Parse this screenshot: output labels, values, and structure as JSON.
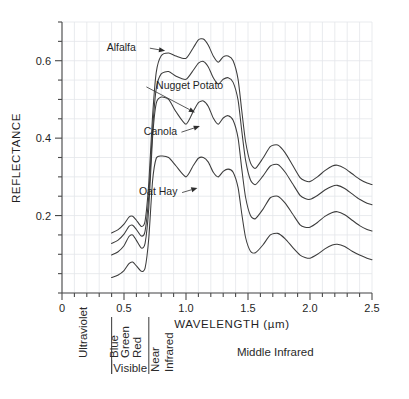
{
  "chart_data": {
    "type": "line",
    "title": "",
    "xlabel": "WAVELENGTH (µm)",
    "ylabel": "REFLECTANCE",
    "xlim": [
      0,
      2.5
    ],
    "ylim": [
      0,
      0.7
    ],
    "x_ticks": [
      "0",
      "0.5",
      "1.0",
      "1.5",
      "2.0",
      "2.5"
    ],
    "x_tick_values": [
      0,
      0.5,
      1.0,
      1.5,
      2.0,
      2.5
    ],
    "x_minor_step": 0.1,
    "y_ticks": [
      "0.2",
      "0.4",
      "0.6"
    ],
    "y_tick_values": [
      0.2,
      0.4,
      0.6
    ],
    "y_minor_step": 0.05,
    "grid": true,
    "legend_position": "inline-annotations",
    "series": [
      {
        "name": "Alfalfa",
        "label_x": 0.36,
        "label_y": 0.635,
        "arrow_to_x": 0.84,
        "arrow_to_y": 0.625,
        "x": [
          0.4,
          0.45,
          0.5,
          0.54,
          0.57,
          0.6,
          0.64,
          0.67,
          0.7,
          0.73,
          0.76,
          0.8,
          0.86,
          0.92,
          1.0,
          1.06,
          1.1,
          1.14,
          1.18,
          1.22,
          1.26,
          1.3,
          1.34,
          1.38,
          1.42,
          1.45,
          1.48,
          1.52,
          1.56,
          1.62,
          1.68,
          1.74,
          1.8,
          1.86,
          1.92,
          1.96,
          2.0,
          2.06,
          2.12,
          2.18,
          2.22,
          2.28,
          2.34,
          2.4,
          2.46,
          2.5
        ],
        "y": [
          0.155,
          0.163,
          0.178,
          0.196,
          0.198,
          0.188,
          0.172,
          0.186,
          0.285,
          0.455,
          0.57,
          0.613,
          0.62,
          0.612,
          0.606,
          0.634,
          0.654,
          0.656,
          0.64,
          0.612,
          0.596,
          0.61,
          0.612,
          0.6,
          0.552,
          0.47,
          0.392,
          0.336,
          0.322,
          0.348,
          0.378,
          0.382,
          0.362,
          0.33,
          0.298,
          0.29,
          0.288,
          0.3,
          0.316,
          0.328,
          0.33,
          0.322,
          0.308,
          0.294,
          0.284,
          0.28
        ]
      },
      {
        "name": "Nugget Potato",
        "label_x": 1.3,
        "label_y": 0.535,
        "arrow_to_x": 1.08,
        "arrow_to_y": 0.465,
        "x": [
          0.4,
          0.45,
          0.5,
          0.54,
          0.57,
          0.6,
          0.64,
          0.67,
          0.7,
          0.73,
          0.76,
          0.8,
          0.86,
          0.92,
          1.0,
          1.06,
          1.1,
          1.14,
          1.18,
          1.22,
          1.26,
          1.3,
          1.34,
          1.38,
          1.42,
          1.45,
          1.48,
          1.52,
          1.56,
          1.62,
          1.68,
          1.74,
          1.8,
          1.86,
          1.92,
          1.96,
          2.0,
          2.06,
          2.12,
          2.18,
          2.22,
          2.28,
          2.34,
          2.4,
          2.46,
          2.5
        ],
        "y": [
          0.128,
          0.136,
          0.152,
          0.172,
          0.175,
          0.164,
          0.147,
          0.16,
          0.252,
          0.42,
          0.528,
          0.566,
          0.572,
          0.56,
          0.552,
          0.576,
          0.594,
          0.598,
          0.584,
          0.556,
          0.54,
          0.552,
          0.556,
          0.544,
          0.498,
          0.418,
          0.344,
          0.292,
          0.28,
          0.302,
          0.328,
          0.332,
          0.312,
          0.282,
          0.252,
          0.244,
          0.242,
          0.252,
          0.266,
          0.276,
          0.278,
          0.27,
          0.256,
          0.242,
          0.232,
          0.228
        ]
      },
      {
        "name": "Canola",
        "label_x": 0.66,
        "label_y": 0.418,
        "arrow_to_x": 1.12,
        "arrow_to_y": 0.432,
        "x": [
          0.4,
          0.45,
          0.5,
          0.54,
          0.57,
          0.6,
          0.64,
          0.67,
          0.7,
          0.73,
          0.76,
          0.8,
          0.86,
          0.92,
          1.0,
          1.06,
          1.1,
          1.14,
          1.18,
          1.22,
          1.26,
          1.3,
          1.34,
          1.38,
          1.42,
          1.45,
          1.48,
          1.52,
          1.56,
          1.62,
          1.68,
          1.74,
          1.8,
          1.86,
          1.92,
          1.96,
          2.0,
          2.06,
          2.12,
          2.18,
          2.22,
          2.28,
          2.34,
          2.4,
          2.46,
          2.5
        ],
        "y": [
          0.098,
          0.106,
          0.122,
          0.146,
          0.15,
          0.136,
          0.116,
          0.128,
          0.22,
          0.4,
          0.49,
          0.506,
          0.5,
          0.468,
          0.436,
          0.47,
          0.492,
          0.496,
          0.482,
          0.452,
          0.436,
          0.452,
          0.458,
          0.446,
          0.4,
          0.32,
          0.248,
          0.2,
          0.192,
          0.216,
          0.246,
          0.25,
          0.232,
          0.204,
          0.176,
          0.17,
          0.17,
          0.182,
          0.198,
          0.208,
          0.21,
          0.202,
          0.188,
          0.174,
          0.164,
          0.16
        ]
      },
      {
        "name": "Oat Hay",
        "label_x": 0.62,
        "label_y": 0.262,
        "arrow_to_x": 1.1,
        "arrow_to_y": 0.272,
        "x": [
          0.4,
          0.45,
          0.5,
          0.54,
          0.57,
          0.6,
          0.64,
          0.67,
          0.7,
          0.73,
          0.76,
          0.8,
          0.86,
          0.92,
          1.0,
          1.06,
          1.1,
          1.14,
          1.18,
          1.22,
          1.26,
          1.3,
          1.34,
          1.38,
          1.42,
          1.45,
          1.48,
          1.52,
          1.56,
          1.62,
          1.68,
          1.74,
          1.8,
          1.86,
          1.92,
          1.96,
          2.0,
          2.06,
          2.12,
          2.18,
          2.22,
          2.28,
          2.34,
          2.4,
          2.46,
          2.5
        ],
        "y": [
          0.04,
          0.046,
          0.058,
          0.076,
          0.08,
          0.07,
          0.056,
          0.064,
          0.142,
          0.288,
          0.348,
          0.354,
          0.35,
          0.328,
          0.3,
          0.33,
          0.348,
          0.35,
          0.338,
          0.312,
          0.3,
          0.314,
          0.32,
          0.312,
          0.272,
          0.204,
          0.144,
          0.108,
          0.104,
          0.124,
          0.15,
          0.154,
          0.14,
          0.118,
          0.098,
          0.092,
          0.09,
          0.1,
          0.114,
          0.124,
          0.126,
          0.12,
          0.108,
          0.098,
          0.09,
          0.086
        ]
      }
    ],
    "spectral_bands": [
      {
        "name": "Ultraviolet",
        "start": 0.0,
        "end": 0.4,
        "orientation": "vertical"
      },
      {
        "name": "Blue",
        "start": 0.4,
        "end": 0.5,
        "orientation": "vertical"
      },
      {
        "name": "Green",
        "start": 0.5,
        "end": 0.58,
        "orientation": "vertical"
      },
      {
        "name": "Red",
        "start": 0.58,
        "end": 0.7,
        "orientation": "vertical"
      },
      {
        "name": "Near Infrared",
        "start": 0.7,
        "end": 1.0,
        "orientation": "vertical"
      },
      {
        "name": "Middle Infrared",
        "start": 1.0,
        "end": 2.5,
        "orientation": "horizontal"
      }
    ],
    "band_group_label": "Visible",
    "band_dividers": [
      0.4,
      0.7
    ]
  },
  "axes": {
    "y_title": "REFLECTANCE",
    "x_title": "WAVELENGTH (µm)"
  },
  "colors": {
    "curve": "#3c3c3c",
    "grid": "#e3e6ea",
    "axis": "#4a4a4a",
    "text": "#1f1f1f",
    "background": "#ffffff"
  }
}
